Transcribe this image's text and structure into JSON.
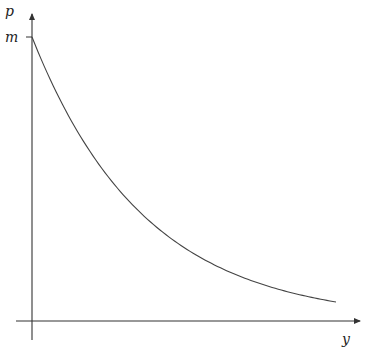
{
  "chart_data": {
    "type": "line",
    "title": "",
    "xlabel": "y",
    "ylabel": "p",
    "yticks": [
      "m"
    ],
    "xticks": [],
    "grid": false,
    "legend": null,
    "series": [
      {
        "name": "p(y)",
        "function": "p = m * exp(-k*y)",
        "x": [
          0,
          0.1,
          0.2,
          0.3,
          0.4,
          0.5,
          0.6,
          0.7,
          0.8,
          0.9,
          1.0
        ],
        "values": [
          1.0,
          0.763,
          0.582,
          0.444,
          0.339,
          0.258,
          0.197,
          0.15,
          0.115,
          0.088,
          0.067
        ],
        "units_note": "y normalized to [0,1] over visible range; p expressed as fraction of m"
      }
    ]
  },
  "labels": {
    "y_axis": "p",
    "x_axis": "y",
    "tick_m": "m"
  },
  "colors": {
    "axis": "#333333",
    "curve": "#444444"
  }
}
